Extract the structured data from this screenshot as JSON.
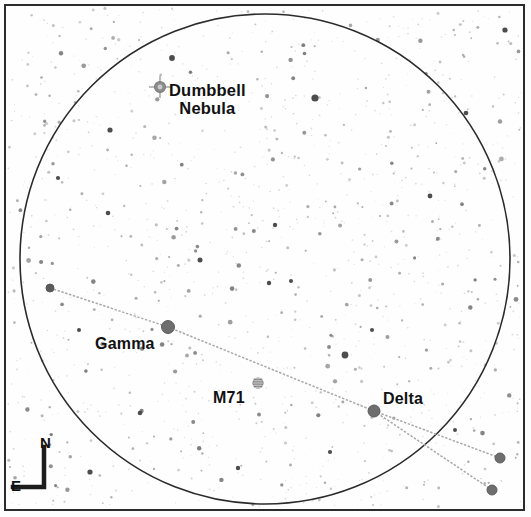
{
  "chart_data": {
    "type": "scatter",
    "title": "",
    "field_of_view_circle": {
      "cx": 265,
      "cy": 259,
      "r": 245
    },
    "grid": false,
    "legend": "none",
    "labels": [
      {
        "id": "dumbbell",
        "text": "Dumbbell\nNebula",
        "x": 169,
        "y": 81
      },
      {
        "id": "gamma",
        "text": "Gamma",
        "x": 95,
        "y": 335
      },
      {
        "id": "m71",
        "text": "M71",
        "x": 213,
        "y": 389
      },
      {
        "id": "delta",
        "text": "Delta",
        "x": 383,
        "y": 390
      }
    ],
    "objects": [
      {
        "name": "Dumbbell Nebula",
        "type": "planetary-nebula",
        "x": 160,
        "y": 87,
        "size": 11,
        "color": "#8c8c8c"
      },
      {
        "name": "M71",
        "type": "globular-cluster",
        "x": 258,
        "y": 383,
        "size": 10,
        "color": "#8f8f8f"
      },
      {
        "name": "Gamma",
        "type": "star",
        "x": 168,
        "y": 327,
        "size": 13,
        "color": "#6e6e6e"
      },
      {
        "name": "Delta",
        "type": "star",
        "x": 374,
        "y": 411,
        "size": 12,
        "color": "#6e6e6e"
      },
      {
        "name": "Alpha",
        "type": "star",
        "x": 50,
        "y": 288,
        "size": 8,
        "color": "#5a5a5a"
      },
      {
        "name": "Eta",
        "type": "star",
        "x": 500,
        "y": 458,
        "size": 10,
        "color": "#6e6e6e"
      },
      {
        "name": "Zeta",
        "type": "star",
        "x": 492,
        "y": 490,
        "size": 10,
        "color": "#6e6e6e"
      }
    ],
    "constellation_lines": [
      {
        "from": "Alpha",
        "to": "Gamma",
        "points": [
          [
            50,
            288
          ],
          [
            168,
            327
          ]
        ]
      },
      {
        "from": "Gamma",
        "to": "Delta",
        "points": [
          [
            168,
            327
          ],
          [
            374,
            411
          ]
        ]
      },
      {
        "from": "Delta",
        "to": "Eta",
        "points": [
          [
            374,
            411
          ],
          [
            500,
            458
          ]
        ]
      },
      {
        "from": "Delta",
        "to": "Zeta",
        "points": [
          [
            374,
            411
          ],
          [
            492,
            490
          ]
        ]
      }
    ],
    "background_stars_note": "dense sparse field of faint grey point stars",
    "xlabel": "",
    "ylabel": ""
  },
  "compass": {
    "north_label": "N",
    "east_label": "E"
  },
  "style": {
    "ink": "#2b2b2b",
    "paper": "#fefefe",
    "star_grey": "#6e6e6e",
    "faint_grey": "#b9b9b9",
    "line_grey": "#a8a8a8"
  }
}
